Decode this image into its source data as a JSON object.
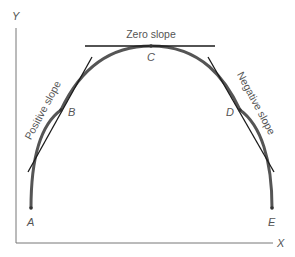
{
  "diagram": {
    "axes": {
      "y_label": "Y",
      "x_label": "X"
    },
    "points": {
      "A": "A",
      "B": "B",
      "C": "C",
      "D": "D",
      "E": "E"
    },
    "annotations": {
      "zero_slope": "Zero slope",
      "positive_slope": "Positive slope",
      "negative_slope": "Negative slope"
    },
    "colors": {
      "curve": "#555555",
      "tangent": "#1a1a1a",
      "axis": "#777777",
      "text": "#555555"
    }
  }
}
